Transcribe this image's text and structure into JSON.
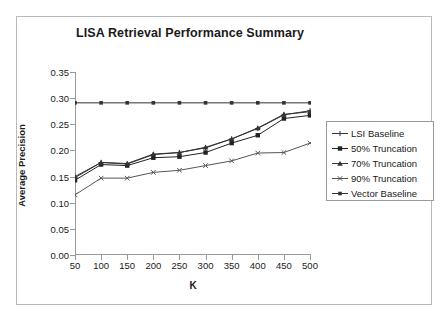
{
  "chart_data": {
    "type": "line",
    "title": "LISA Retrieval Performance Summary",
    "xlabel": "K",
    "ylabel": "Average Precision",
    "x": [
      50,
      100,
      150,
      200,
      250,
      300,
      350,
      400,
      450,
      500
    ],
    "xtick_labels": [
      "50",
      "100",
      "150",
      "200",
      "250",
      "300",
      "350",
      "400",
      "450",
      "500"
    ],
    "ytick_labels": [
      "0.00",
      "0.05",
      "0.10",
      "0.15",
      "0.20",
      "0.25",
      "0.30",
      "0.35"
    ],
    "ytick_values": [
      0.0,
      0.05,
      0.1,
      0.15,
      0.2,
      0.25,
      0.3,
      0.35
    ],
    "xlim": [
      50,
      500
    ],
    "ylim": [
      0.0,
      0.35
    ],
    "grid": false,
    "legend_position": "right",
    "series": [
      {
        "name": "LSI Baseline",
        "marker": "plus",
        "color": "#333333",
        "values": [
          0.148,
          0.177,
          0.174,
          0.192,
          0.196,
          0.205,
          0.222,
          0.242,
          0.268,
          0.276
        ]
      },
      {
        "name": "50% Truncation",
        "marker": "square",
        "color": "#222222",
        "values": [
          0.143,
          0.173,
          0.171,
          0.186,
          0.188,
          0.196,
          0.214,
          0.229,
          0.261,
          0.267
        ]
      },
      {
        "name": "70% Truncation",
        "marker": "triangle",
        "color": "#333333",
        "values": [
          0.15,
          0.177,
          0.175,
          0.193,
          0.196,
          0.206,
          0.222,
          0.243,
          0.269,
          0.274
        ]
      },
      {
        "name": "90% Truncation",
        "marker": "cross",
        "color": "#555555",
        "values": [
          0.115,
          0.147,
          0.147,
          0.158,
          0.162,
          0.171,
          0.18,
          0.195,
          0.196,
          0.214
        ]
      },
      {
        "name": "Vector Baseline",
        "marker": "square-small",
        "color": "#333333",
        "values": [
          0.291,
          0.291,
          0.291,
          0.291,
          0.291,
          0.291,
          0.291,
          0.291,
          0.291,
          0.291
        ]
      }
    ]
  },
  "colors": {
    "frame": "#b9b9b9",
    "axis": "#9a9a9a",
    "text": "#1a1a1a",
    "background": "#ffffff"
  }
}
